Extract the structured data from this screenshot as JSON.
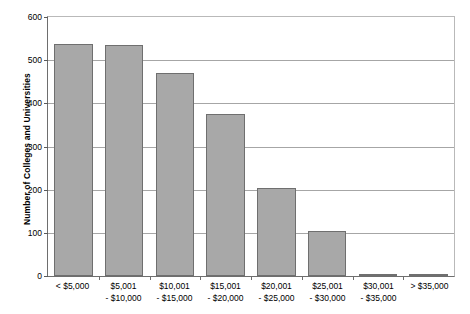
{
  "chart_data": {
    "type": "bar",
    "title": "",
    "xlabel": "",
    "ylabel": "Number of Colleges and Universities",
    "ylim": [
      0,
      600
    ],
    "ytick_labels": [
      "600",
      "500",
      "400",
      "300",
      "200",
      "100",
      "0"
    ],
    "yticks": [
      600,
      500,
      400,
      300,
      200,
      100,
      0
    ],
    "grid": true,
    "legend": "none",
    "bar_color": "#a8a8a8",
    "bar_border_color": "#6f6f6f",
    "categories": [
      "< $5,000",
      "$5,001 - $10,000",
      "$10,001 - $15,000",
      "$15,001 - $20,000",
      "$20,001 - $25,000",
      "$25,001 - $30,000",
      "$30,001 - $35,000",
      "> $35,000"
    ],
    "category_lines": [
      {
        "line1": "< $5,000",
        "line2": ""
      },
      {
        "line1": "$5,001",
        "line2": "- $10,000"
      },
      {
        "line1": "$10,001",
        "line2": "- $15,000"
      },
      {
        "line1": "$15,001",
        "line2": "- $20,000"
      },
      {
        "line1": "$20,001",
        "line2": "- $25,000"
      },
      {
        "line1": "$25,001",
        "line2": "- $30,000"
      },
      {
        "line1": "$30,001",
        "line2": "- $35,000"
      },
      {
        "line1": "> $35,000",
        "line2": ""
      }
    ],
    "values": [
      537,
      535,
      470,
      375,
      205,
      104,
      5,
      1
    ]
  }
}
